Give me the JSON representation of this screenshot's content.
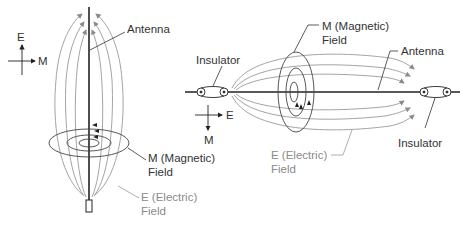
{
  "figure": {
    "vertical_antenna": {
      "axes": {
        "vertical": "E",
        "horizontal": "M"
      },
      "labels": {
        "antenna": "Antenna",
        "magnetic_line1": "M (Magnetic)",
        "magnetic_line2": "Field",
        "electric_line1": "E (Electric)",
        "electric_line2": "Field"
      }
    },
    "horizontal_antenna": {
      "axes": {
        "horizontal": "E",
        "vertical": "M"
      },
      "labels": {
        "insulator_left": "Insulator",
        "insulator_right": "Insulator",
        "antenna": "Antenna",
        "magnetic_line1": "M (Magnetic)",
        "magnetic_line2": "Field",
        "electric_line1": "E (Electric)",
        "electric_line2": "Field"
      }
    }
  },
  "colors": {
    "antenna": "#222222",
    "magnetic_field": "#444444",
    "electric_field": "#9a9a9a",
    "text": "#333333",
    "text_muted": "#8a8a8a"
  }
}
